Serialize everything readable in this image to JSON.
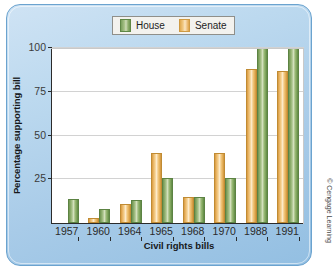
{
  "chart_data": {
    "type": "bar",
    "title": "",
    "xlabel": "Civil rights bills",
    "ylabel": "Percentage supporting bill",
    "categories": [
      "1957",
      "1960",
      "1964",
      "1965",
      "1968",
      "1970",
      "1988",
      "1991"
    ],
    "series": [
      {
        "name": "Senate",
        "color": "#efc37d",
        "values": [
          null,
          3,
          11,
          40,
          15,
          40,
          88,
          87
        ]
      },
      {
        "name": "House",
        "color": "#8dad6b",
        "values": [
          14,
          8,
          13,
          26,
          15,
          26,
          100,
          100
        ]
      }
    ],
    "series_order_in_group": [
      "Senate",
      "House"
    ],
    "ylim": [
      0,
      100
    ],
    "yticks": [
      25,
      50,
      75,
      100
    ],
    "ytick_labels": [
      "25",
      "50",
      "75",
      "100"
    ],
    "grid": true,
    "legend_position": "top-center",
    "legend_entries": [
      "House",
      "Senate"
    ]
  },
  "legend": {
    "house_label": "House",
    "senate_label": "Senate"
  },
  "axes": {
    "y_title": "Percentage supporting bill",
    "x_title": "Civil rights bills"
  },
  "credit": {
    "text": "© Cengage Learning"
  },
  "colors": {
    "house": "#8dad6b",
    "senate": "#efc37d",
    "panel_background": "#b3d2ea",
    "plot_background": "#ffffff",
    "axis": "#2b2b2b",
    "gridline": "#d2d2d2"
  }
}
